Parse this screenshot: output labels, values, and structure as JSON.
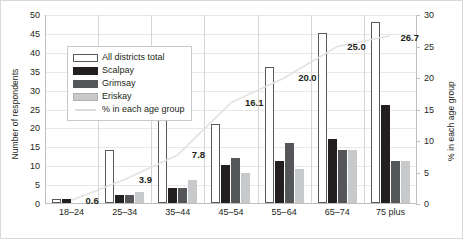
{
  "chart_data": {
    "type": "bar",
    "title": "",
    "subtitle": "",
    "categories": [
      "18–24",
      "25–34",
      "35–44",
      "45–54",
      "55–64",
      "65–74",
      "75 plus"
    ],
    "series": [
      {
        "name": "All districts total",
        "type": "bar",
        "axis": "left",
        "color": "#ffffff",
        "values": [
          1,
          14,
          29,
          21,
          36,
          45,
          48
        ]
      },
      {
        "name": "Scalpay",
        "type": "bar",
        "axis": "left",
        "color": "#231f20",
        "values": [
          1,
          2,
          4,
          10,
          11,
          17,
          26
        ]
      },
      {
        "name": "Grimsay",
        "type": "bar",
        "axis": "left",
        "color": "#54565a",
        "values": [
          0,
          2,
          4,
          12,
          16,
          14,
          11
        ]
      },
      {
        "name": "Eriskay",
        "type": "bar",
        "axis": "left",
        "color": "#c8c9ca",
        "values": [
          0,
          3,
          6,
          8,
          9,
          14,
          11
        ]
      },
      {
        "name": "% in each age group",
        "type": "line",
        "axis": "right",
        "color": "#e2e2e2",
        "values": [
          0.6,
          3.9,
          7.8,
          16.1,
          20.0,
          25.0,
          26.7
        ]
      }
    ],
    "data_labels": [
      "0.6",
      "3.9",
      "7.8",
      "16.1",
      "20.0",
      "25.0",
      "26.7"
    ],
    "xlabel": "",
    "ylabel": "Number of respondents",
    "y2label": "% in each age group",
    "ylim": [
      0,
      50
    ],
    "y2lim": [
      0,
      30
    ],
    "yticks": [
      "0",
      "5",
      "10",
      "15",
      "20",
      "25",
      "30",
      "35",
      "40",
      "45",
      "50"
    ],
    "y2ticks": [
      "0",
      "5",
      "10",
      "15",
      "20",
      "25",
      "30"
    ],
    "grid": true,
    "legend_position": "inside-upper-left"
  },
  "legend": {
    "items": [
      {
        "label": "All districts total",
        "swatch": "total"
      },
      {
        "label": "Scalpay",
        "swatch": "scalpay"
      },
      {
        "label": "Grimsay",
        "swatch": "grimsay"
      },
      {
        "label": "Eriskay",
        "swatch": "eriskay"
      },
      {
        "label": "% in each age group",
        "swatch": "line"
      }
    ]
  }
}
